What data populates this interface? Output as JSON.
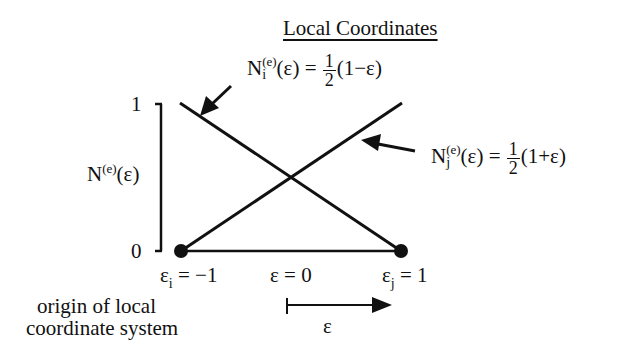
{
  "title": "Local Coordinates",
  "axis": {
    "y_label_base": "N",
    "y_label_sup": "(e)",
    "y_label_arg": "(ε)",
    "tick_top": "1",
    "tick_bottom": "0"
  },
  "shape_function_i": {
    "base": "N",
    "sub": "i",
    "sup": "(e)",
    "arg": "(ε) =",
    "num": "1",
    "den": "2",
    "tail": "(1−ε)"
  },
  "shape_function_j": {
    "base": "N",
    "sub": "j",
    "sup": "(e)",
    "arg": "(ε) =",
    "num": "1",
    "den": "2",
    "tail": "(1+ε)"
  },
  "nodes": {
    "left_base": "ε",
    "left_sub": "i",
    "left_rest": " = −1",
    "center": "ε = 0",
    "right_base": "ε",
    "right_sub": "j",
    "right_rest": " = 1"
  },
  "origin_note_line1": "origin of local",
  "origin_note_line2": "coordinate system",
  "direction_label": "ε",
  "colors": {
    "ink": "#111111",
    "background": "#ffffff"
  }
}
